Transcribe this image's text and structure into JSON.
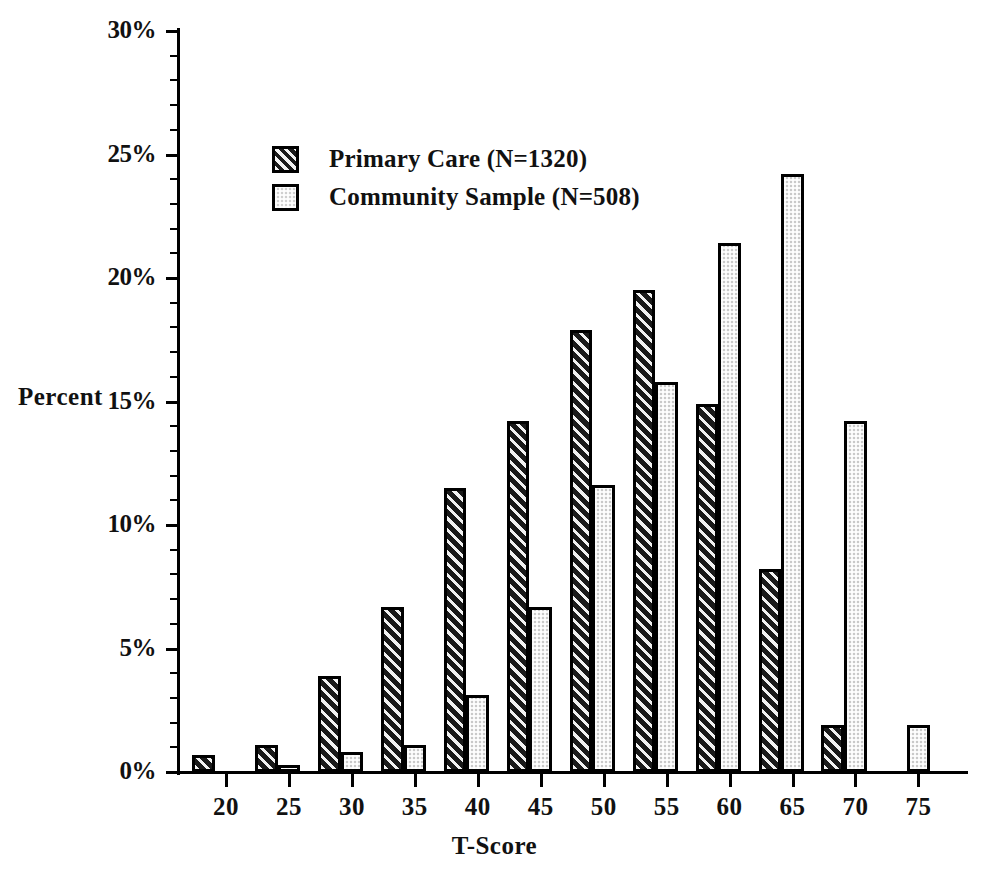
{
  "chart_data": {
    "type": "bar",
    "title": "",
    "xlabel": "T-Score",
    "ylabel": "Percent",
    "categories": [
      "20",
      "25",
      "30",
      "35",
      "40",
      "45",
      "50",
      "55",
      "60",
      "65",
      "70",
      "75"
    ],
    "series": [
      {
        "name": "Primary Care (N=1320)",
        "fill": "diagonal-hatch-dark",
        "color": "#2b2b2b",
        "values": [
          0.7,
          1.1,
          3.9,
          6.7,
          11.5,
          14.2,
          17.9,
          19.5,
          14.9,
          8.2,
          1.9,
          0.0
        ]
      },
      {
        "name": "Community Sample (N=508)",
        "fill": "stipple-light-gray",
        "color": "#c9c9c9",
        "values": [
          0.0,
          0.3,
          0.8,
          1.1,
          3.1,
          6.7,
          11.6,
          15.8,
          21.4,
          24.2,
          14.2,
          1.9
        ]
      }
    ],
    "ylim": [
      0,
      30
    ],
    "ytick_labels": [
      "0%",
      "5%",
      "10%",
      "15%",
      "20%",
      "25%",
      "30%"
    ],
    "ytick_values": [
      0,
      5,
      10,
      15,
      20,
      25,
      30
    ],
    "yminor_step": 1,
    "grid": false,
    "legend_position": "upper-left-inside",
    "units": "percent"
  },
  "axes": {
    "y_title": "Percent",
    "x_title": "T-Score"
  },
  "legend": {
    "items": [
      {
        "label": "Primary Care (N=1320)",
        "swatch": "primary"
      },
      {
        "label": "Community Sample (N=508)",
        "swatch": "community"
      }
    ]
  }
}
